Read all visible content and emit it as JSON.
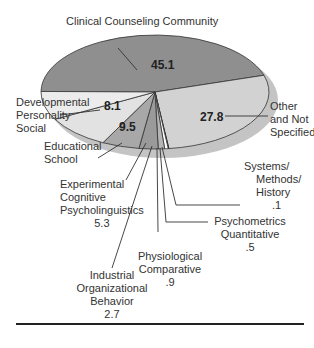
{
  "chart_data": {
    "type": "pie",
    "title": "",
    "unit": "percent",
    "slices": [
      {
        "label": "Clinical Counseling Community",
        "value": 45.1,
        "color": "#8f8f8f"
      },
      {
        "label": "Other and Not Specified",
        "value": 27.8,
        "color": "#d2d2d2"
      },
      {
        "label": "Systems/ Methods/ History",
        "value": 0.1,
        "color": "#111111"
      },
      {
        "label": "Psychometrics Quantitative",
        "value": 0.5,
        "color": "#ffffff"
      },
      {
        "label": "Physiological Comparative",
        "value": 0.9,
        "color": "#b5b5b5"
      },
      {
        "label": "Industrial Organizational Behavior",
        "value": 2.7,
        "color": "#9a9a9a"
      },
      {
        "label": "Experimental Cognitive Psycholinguistics",
        "value": 5.3,
        "color": "#a8a8a8"
      },
      {
        "label": "Educational School",
        "value": 9.5,
        "color": "#e2e2e2"
      },
      {
        "label": "Developmental Personality Social",
        "value": 8.1,
        "color": "#ececec"
      }
    ],
    "shadow_color": "#c4c4c4"
  },
  "labels": {
    "clinical": "Clinical Counseling Community",
    "clinical_value": "45.1",
    "other_1": "Other",
    "other_2": "and Not",
    "other_3": "Specified",
    "other_value": "27.8",
    "dev_1": "Developmental",
    "dev_2": "Personality",
    "dev_3": "Social",
    "dev_value": "8.1",
    "edu_1": "Educational",
    "edu_2": "School",
    "edu_value": "9.5",
    "exp_1": "Experimental",
    "exp_2": "Cognitive",
    "exp_3": "Psycholinguistics",
    "exp_value": "5.3",
    "ind_1": "Industrial",
    "ind_2": "Organizational",
    "ind_3": "Behavior",
    "ind_value": "2.7",
    "phys_1": "Physiological",
    "phys_2": "Comparative",
    "phys_value": ".9",
    "psy_1": "Psychometrics",
    "psy_2": "Quantitative",
    "psy_value": ".5",
    "sys_1": "Systems/",
    "sys_2": "Methods/",
    "sys_3": "History",
    "sys_value": ".1"
  }
}
